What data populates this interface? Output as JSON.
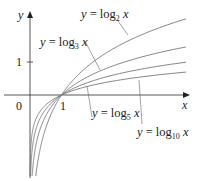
{
  "chart_data": {
    "type": "line",
    "title": "",
    "xlabel": "x",
    "ylabel": "y",
    "xlim": [
      0,
      5
    ],
    "ylim": [
      -2.5,
      2.5
    ],
    "grid": false,
    "ticks": {
      "x": [
        "0",
        "1"
      ],
      "y": [
        "1"
      ]
    },
    "series": [
      {
        "name": "y = log_2 x",
        "base": 2
      },
      {
        "name": "y = log_3 x",
        "base": 3
      },
      {
        "name": "y = log_5 x",
        "base": 5
      },
      {
        "name": "y = log_10 x",
        "base": 10
      }
    ],
    "annotations": [
      {
        "text": "y = log2 x",
        "pointer_to": "log_2 curve"
      },
      {
        "text": "y = log3 x",
        "pointer_to": "log_3 curve"
      },
      {
        "text": "y = log5 x",
        "pointer_to": "log_5 curve"
      },
      {
        "text": "y = log10 x",
        "pointer_to": "log_10 curve"
      }
    ]
  },
  "labels": {
    "axis_x": "x",
    "axis_y": "y",
    "origin": "0",
    "tick_x1": "1",
    "tick_y1": "1",
    "eq_prefix": "y = log",
    "var": "x",
    "sub2": "2",
    "sub3": "3",
    "sub5": "5",
    "sub10": "10"
  },
  "colors": {
    "axis": "#444444",
    "curve": "#777777",
    "text": "#222222"
  }
}
